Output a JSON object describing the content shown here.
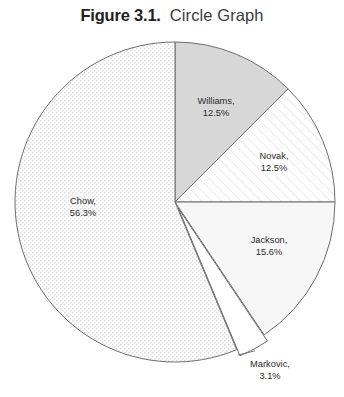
{
  "title": {
    "label": "Figure 3.1.",
    "text": "Circle Graph"
  },
  "chart_data": {
    "type": "pie",
    "title": "Circle Graph",
    "xlabel": "",
    "ylabel": "",
    "categories": [
      "Williams",
      "Novak",
      "Jackson",
      "Markovic",
      "Chow"
    ],
    "values": [
      12.5,
      12.5,
      15.6,
      3.1,
      56.3
    ],
    "value_unit": "%",
    "start_angle_deg": 0,
    "direction": "clockwise",
    "legend": "none",
    "grid": false,
    "slices": [
      {
        "name": "Williams",
        "value": 12.5,
        "label_line1": "Williams,",
        "label_line2": "12.5%",
        "fill": "#d7d7d7",
        "pattern": "solid",
        "label_x": 216,
        "label_y": 104,
        "exploded": false,
        "leader": false
      },
      {
        "name": "Novak",
        "value": 12.5,
        "label_line1": "Novak,",
        "label_line2": "12.5%",
        "fill": "#fdfdfd",
        "pattern": "diagonal-hatch",
        "label_x": 274,
        "label_y": 159,
        "exploded": false,
        "leader": false
      },
      {
        "name": "Jackson",
        "value": 15.6,
        "label_line1": "Jackson,",
        "label_line2": "15.6%",
        "fill": "#f7f7f7",
        "pattern": "solid",
        "label_x": 269,
        "label_y": 243,
        "exploded": false,
        "leader": false
      },
      {
        "name": "Markovic",
        "value": 3.1,
        "label_line1": "Markovic,",
        "label_line2": "3.1%",
        "fill": "#ffffff",
        "pattern": "solid",
        "label_x": 270,
        "label_y": 367,
        "exploded": true,
        "leader": true
      },
      {
        "name": "Chow",
        "value": 56.3,
        "label_line1": "Chow,",
        "label_line2": "56.3%",
        "fill": "#fafafa",
        "pattern": "dot-stipple",
        "label_x": 83,
        "label_y": 204,
        "exploded": false,
        "leader": false
      }
    ],
    "geometry": {
      "center_x": 175,
      "center_y": 202,
      "radius": 160
    },
    "stroke_color": "#6d6d6d",
    "background": "#ffffff"
  }
}
